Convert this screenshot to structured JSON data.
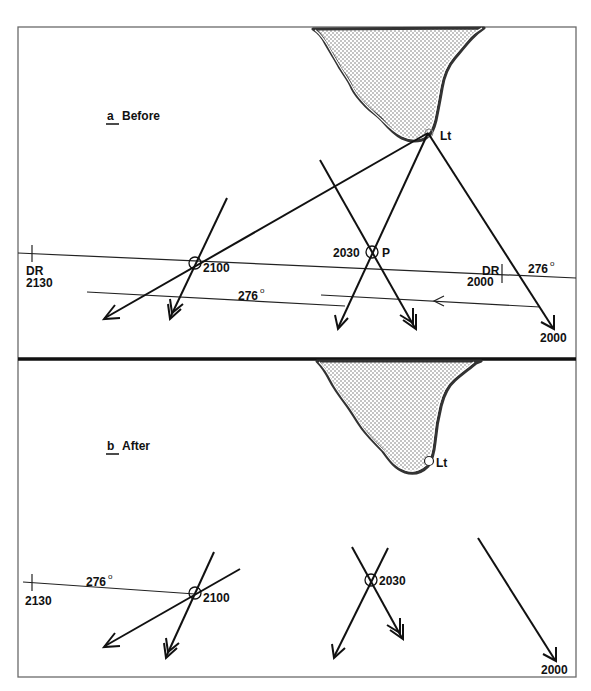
{
  "figure": {
    "colors": {
      "ink": "#111111",
      "frame": "#6a6a6a",
      "land_fill": "#dcdcdc",
      "background": "#ffffff"
    }
  },
  "panel_a": {
    "prefix": "a",
    "title": "Before",
    "light_label": "Lt",
    "fix_2100_label": "2100",
    "fix_2030_label": "2030",
    "fix_p_label": "P",
    "dr_2130_line1": "DR",
    "dr_2130_line2": "2130",
    "dr_2000_line1": "DR",
    "dr_2000_line2": "2000",
    "course_label_right": "276",
    "course_label_lower": "276",
    "degree_symbol": "o",
    "bearing_2000_label": "2000"
  },
  "panel_b": {
    "prefix": "b",
    "title": "After",
    "light_label": "Lt",
    "dr_2130_label": "2130",
    "course_label": "276",
    "degree_symbol": "o",
    "fix_2100_label": "2100",
    "fix_2030_label": "2030",
    "bearing_2000_label": "2000"
  }
}
